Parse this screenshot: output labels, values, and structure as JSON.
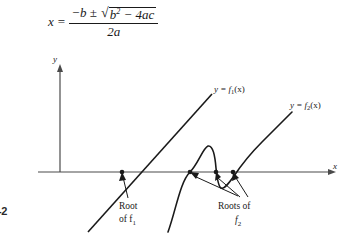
{
  "figure": {
    "formula": {
      "lhs": "x",
      "equals": "=",
      "numerator_lead": "−b ±",
      "radicand_base": "b",
      "radicand_exp": "2",
      "radicand_rest": "− 4ac",
      "denominator": "2a",
      "plain_text": "x = (−b ± √(b² − 4ac)) / 2a"
    },
    "axes": {
      "x_label": "x",
      "y_label": "y",
      "origin_px": {
        "x": 60,
        "y": 122
      }
    },
    "curves": [
      {
        "id": "f1",
        "label": "y = f",
        "label_sub": "1",
        "label_tail": "(x)",
        "type": "line",
        "description": "straight line with positive slope crossing x-axis at single root"
      },
      {
        "id": "f2",
        "label": "y = f",
        "label_sub": "2",
        "label_tail": "(x)",
        "type": "oscillating",
        "description": "curve that oscillates crossing x-axis at three roots then rises"
      }
    ],
    "annotations": [
      {
        "id": "root-f1",
        "line1": "Root",
        "line2_lead": "of f",
        "line2_sub": "1"
      },
      {
        "id": "roots-f2",
        "line1": "Roots of",
        "line2_lead": "f",
        "line2_sub": "2"
      }
    ],
    "page_marker": "-2",
    "colors": {
      "ink": "#1a1a1a",
      "axis": "#4a4a4a",
      "background": "#ffffff"
    }
  }
}
